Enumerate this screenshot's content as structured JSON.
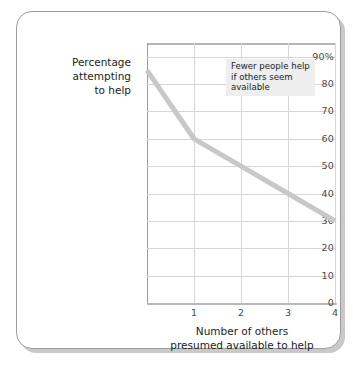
{
  "figure": {
    "name": "bystander-effect-line-chart",
    "card_background": "#ffffff",
    "card_border_color": "#9d9d9d",
    "shadow_color": "#c9c9c9"
  },
  "annotation": {
    "text": "Fewer people help\nif others seem\navailable",
    "background": "#eeeeee"
  },
  "chart_data": {
    "type": "line",
    "title": "",
    "xlabel": "Number of others\npresumed available to help",
    "xlabel_line1": "Number of others",
    "xlabel_line2": "presumed available to help",
    "ylabel": "Percentage attempting to help",
    "ylabel_line1": "Percentage",
    "ylabel_line2": "attempting",
    "ylabel_line3": "to help",
    "x": [
      0,
      1,
      2,
      3,
      4
    ],
    "values": [
      85,
      60,
      50,
      40,
      30
    ],
    "series": [
      {
        "name": "Percentage attempting to help",
        "values": [
          85,
          60,
          50,
          40,
          30
        ],
        "color": "#c8c8c8"
      }
    ],
    "xlim": [
      0,
      4
    ],
    "ylim": [
      0,
      95
    ],
    "xticks": [
      "1",
      "2",
      "3",
      "4"
    ],
    "xtick_values": [
      1,
      2,
      3,
      4
    ],
    "yticks": [
      "0",
      "10",
      "20",
      "30",
      "40",
      "50",
      "60",
      "70",
      "80",
      "90%"
    ],
    "ytick_values": [
      0,
      10,
      20,
      30,
      40,
      50,
      60,
      70,
      80,
      90
    ],
    "grid": true,
    "grid_color": "#d6d6d6",
    "axis_color": "#9a9a9a",
    "legend": "none",
    "annotations": [
      {
        "text": "Fewer people help if others seem available",
        "x": 2,
        "y": 88
      }
    ]
  }
}
